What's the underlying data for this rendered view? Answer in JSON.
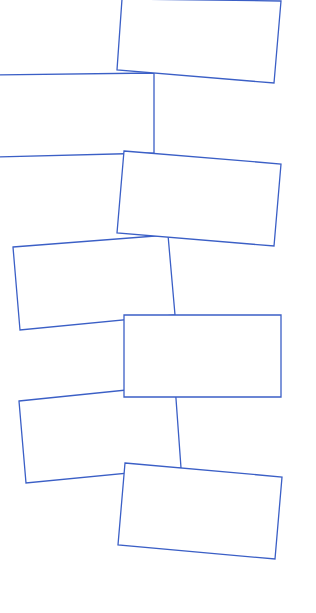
{
  "canvas": {
    "width": 316,
    "height": 613,
    "background": "#ffffff"
  },
  "style": {
    "stroke_color": "#3b5fc6",
    "fill_color": "#ffffff"
  },
  "shapes": [
    {
      "id": "rect-1",
      "type": "rectangle",
      "points": [
        [
          122,
          -1
        ],
        [
          281,
          1
        ],
        [
          274,
          83
        ],
        [
          117,
          70
        ]
      ]
    },
    {
      "id": "rect-2",
      "type": "rectangle",
      "points": [
        [
          -2,
          75
        ],
        [
          154,
          73
        ],
        [
          154,
          153
        ],
        [
          -2,
          157
        ]
      ]
    },
    {
      "id": "rect-3",
      "type": "rectangle",
      "points": [
        [
          124,
          151
        ],
        [
          281,
          164
        ],
        [
          274,
          246
        ],
        [
          117,
          233
        ]
      ]
    },
    {
      "id": "rect-4",
      "type": "rectangle",
      "points": [
        [
          13,
          247
        ],
        [
          168,
          235
        ],
        [
          175,
          315
        ],
        [
          20,
          330
        ]
      ]
    },
    {
      "id": "rect-5",
      "type": "rectangle",
      "points": [
        [
          124,
          315
        ],
        [
          281,
          315
        ],
        [
          281,
          397
        ],
        [
          124,
          397
        ]
      ]
    },
    {
      "id": "rect-6",
      "type": "rectangle",
      "points": [
        [
          19,
          401
        ],
        [
          175,
          385
        ],
        [
          181,
          468
        ],
        [
          26,
          483
        ]
      ]
    },
    {
      "id": "rect-7",
      "type": "rectangle",
      "points": [
        [
          125,
          463
        ],
        [
          282,
          477
        ],
        [
          275,
          559
        ],
        [
          118,
          545
        ]
      ]
    }
  ],
  "draw_order": [
    "rect-2",
    "rect-1",
    "rect-4",
    "rect-3",
    "rect-6",
    "rect-5",
    "rect-7"
  ]
}
